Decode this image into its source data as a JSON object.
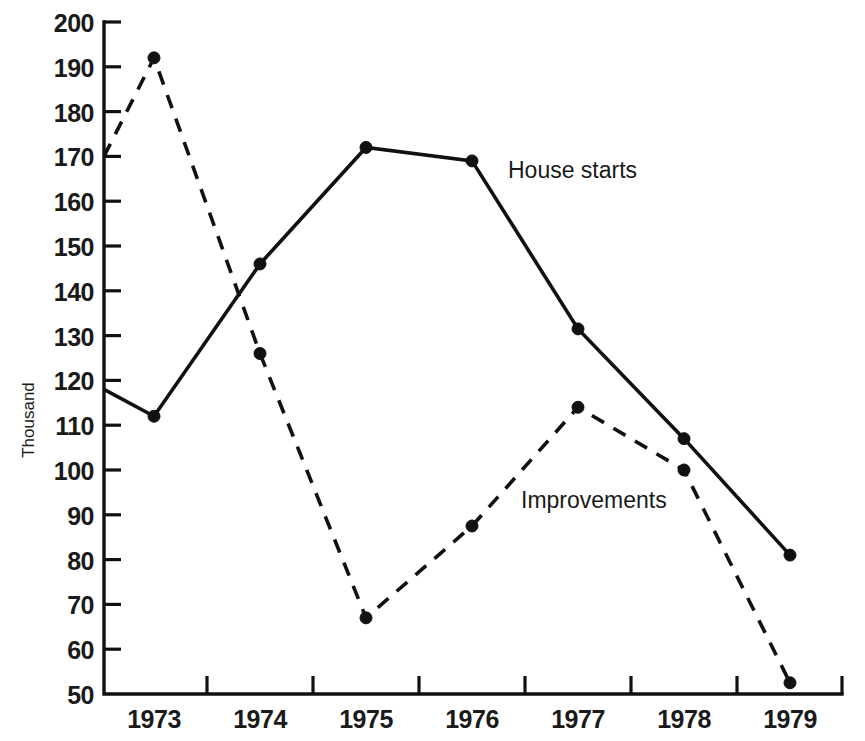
{
  "chart_data": {
    "type": "line",
    "title": "",
    "xlabel": "",
    "ylabel": "Thousand",
    "x": [
      "1973",
      "1974",
      "1975",
      "1976",
      "1977",
      "1978",
      "1979"
    ],
    "categories": [
      "1973",
      "1974",
      "1975",
      "1976",
      "1977",
      "1978",
      "1979"
    ],
    "ylim": [
      50,
      200
    ],
    "y_ticks": [
      200,
      190,
      180,
      170,
      160,
      150,
      140,
      130,
      120,
      110,
      100,
      90,
      80,
      70,
      60,
      50
    ],
    "grid": false,
    "legend_position": "inline-annotation",
    "series": [
      {
        "name": "House starts",
        "style": "solid",
        "values": [
          112,
          146,
          172,
          169,
          131.5,
          107,
          81
        ],
        "left_edge_value": 118,
        "marker": "filled-circle"
      },
      {
        "name": "Improvements",
        "style": "dashed",
        "values": [
          192,
          126,
          67,
          87.5,
          114,
          100,
          52.5
        ],
        "left_edge_value": 170,
        "marker": "filled-circle"
      }
    ],
    "annotations": [
      {
        "text": "House starts",
        "x_px": 508,
        "y_px": 178
      },
      {
        "text": "Improvements",
        "x_px": 521,
        "y_px": 508
      }
    ]
  },
  "axes": {
    "y_axis_label": "Thousand",
    "y_tick_labels": [
      "200",
      "190",
      "180",
      "170",
      "160",
      "150",
      "140",
      "130",
      "120",
      "110",
      "100",
      "90",
      "80",
      "70",
      "60",
      "50"
    ],
    "x_tick_labels": [
      "1973",
      "1974",
      "1975",
      "1976",
      "1977",
      "1978",
      "1979"
    ]
  },
  "labels": {
    "series_house_starts": "House starts",
    "series_improvements": "Improvements"
  },
  "colors": {
    "ink": "#111111",
    "background": "#ffffff"
  }
}
